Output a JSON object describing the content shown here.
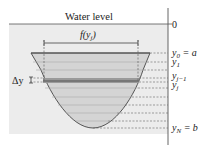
{
  "diagram": {
    "title_label": "Water level",
    "surface_value": "0",
    "width_label": "f(y",
    "width_label_sub": "j",
    "width_label_close": ")",
    "delta_label": "Δy",
    "levels": [
      {
        "main": "y",
        "sub": "0",
        "suffix": " = a"
      },
      {
        "main": "y",
        "sub": "1",
        "suffix": ""
      },
      {
        "main": "y",
        "sub": "j−1",
        "suffix": ""
      },
      {
        "main": "y",
        "sub": "j",
        "suffix": ""
      },
      {
        "main": "y",
        "sub": "N",
        "suffix": " = b"
      }
    ],
    "colors": {
      "water": "#ececec",
      "plate": "#d2d2d2",
      "strip": "#8a8a8a",
      "line": "#444444"
    }
  }
}
